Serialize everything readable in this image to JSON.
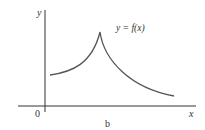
{
  "diagram": {
    "axis_labels": {
      "y": "y",
      "x": "x",
      "origin": "0"
    },
    "curve_label": "y = f(x)",
    "caption": "b",
    "colors": {
      "axes": "#333333",
      "curve": "#555555",
      "background": "#ffffff"
    },
    "curve": {
      "description": "Function rises from left, forms a sharp cusp peak, then decays to the right",
      "start": [
        50,
        75
      ],
      "peak": [
        100,
        32
      ],
      "end": [
        174,
        96
      ]
    }
  }
}
